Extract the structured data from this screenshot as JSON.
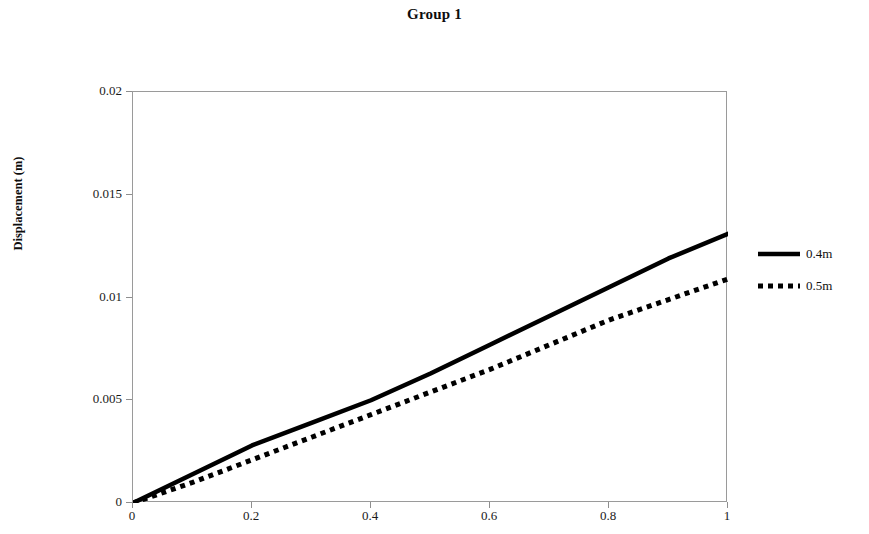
{
  "chart_data": {
    "type": "line",
    "title": "Group 1",
    "xlabel": "",
    "ylabel": "Displacement (m)",
    "xlim": [
      0,
      1
    ],
    "ylim": [
      0,
      0.02
    ],
    "grid": false,
    "legend_position": "right",
    "x_ticks": [
      "0",
      "0.2",
      "0.4",
      "0.6",
      "0.8",
      "1"
    ],
    "x_tick_values": [
      0,
      0.2,
      0.4,
      0.6,
      0.8,
      1
    ],
    "y_ticks": [
      "0",
      "0.005",
      "0.01",
      "0.015",
      "0.02"
    ],
    "y_tick_values": [
      0,
      0.005,
      0.01,
      0.015,
      0.02
    ],
    "x": [
      0,
      0.1,
      0.2,
      0.3,
      0.4,
      0.5,
      0.6,
      0.7,
      0.8,
      0.9,
      1
    ],
    "series": [
      {
        "name": "0.4m",
        "style": "solid",
        "color": "#000000",
        "values": [
          0,
          0.0014,
          0.0028,
          0.0039,
          0.005,
          0.0063,
          0.0077,
          0.0091,
          0.0105,
          0.0119,
          0.0131
        ]
      },
      {
        "name": "0.5m",
        "style": "dotted",
        "color": "#000000",
        "values": [
          0,
          0.001,
          0.0021,
          0.0032,
          0.0043,
          0.0054,
          0.0065,
          0.0077,
          0.0089,
          0.0099,
          0.0109
        ]
      }
    ]
  },
  "legend": {
    "items": [
      {
        "label": "0.4m",
        "style": "solid"
      },
      {
        "label": "0.5m",
        "style": "dotted"
      }
    ]
  }
}
